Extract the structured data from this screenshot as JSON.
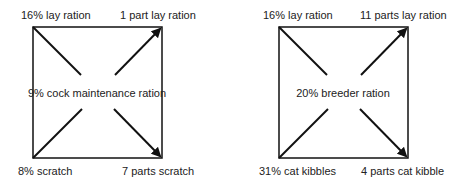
{
  "diagrams": [
    {
      "name": "cock-maintenance-square",
      "top_left": "16% lay ration",
      "top_right": "1 part lay ration",
      "center": "9% cock maintenance ration",
      "bottom_left": "8% scratch",
      "bottom_right": "7 parts scratch"
    },
    {
      "name": "breeder-square",
      "top_left": "16% lay ration",
      "top_right": "11 parts lay ration",
      "center": "20% breeder ration",
      "bottom_left": "31% cat kibbles",
      "bottom_right": "4 parts cat kibble"
    }
  ],
  "colors": {
    "line": "#111111",
    "text": "#222222",
    "background": "#ffffff"
  }
}
